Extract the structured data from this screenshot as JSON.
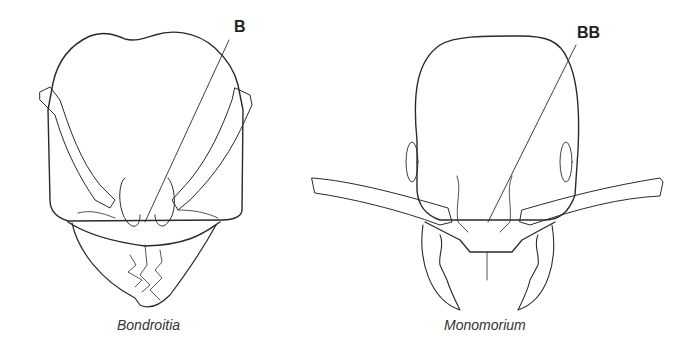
{
  "figure": {
    "panels": [
      {
        "caption": "Bondroitia",
        "label": "B"
      },
      {
        "caption": "Monomorium",
        "label": "BB"
      }
    ]
  },
  "colors": {
    "line": "#2a2a2a",
    "background": "#ffffff"
  }
}
